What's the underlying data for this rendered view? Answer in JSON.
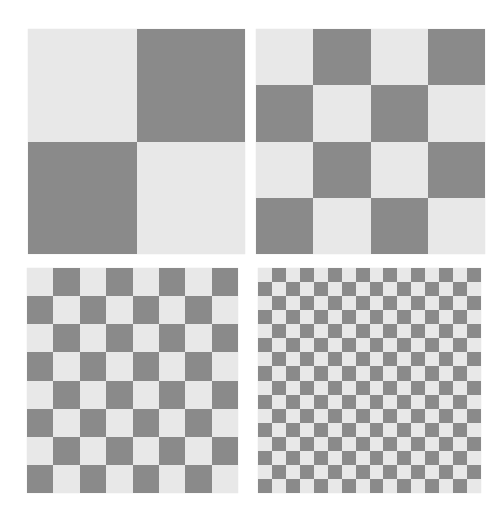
{
  "figure": {
    "canvas": {
      "width": 495,
      "height": 522,
      "background": "#ffffff"
    },
    "colors": {
      "light": "#e8e8e8",
      "dark": "#8a8a8a"
    },
    "boards": [
      {
        "name": "checkerboard-2x2",
        "grid": 2,
        "x": 28,
        "y": 29,
        "width": 217,
        "height": 225,
        "first_cell": "light"
      },
      {
        "name": "checkerboard-4x4",
        "grid": 4,
        "x": 256,
        "y": 29,
        "width": 229,
        "height": 225,
        "first_cell": "light"
      },
      {
        "name": "checkerboard-8x8",
        "grid": 8,
        "x": 27,
        "y": 268,
        "width": 211,
        "height": 225,
        "first_cell": "light"
      },
      {
        "name": "checkerboard-16x16",
        "grid": 16,
        "x": 258,
        "y": 268,
        "width": 223,
        "height": 225,
        "first_cell": "light"
      }
    ]
  }
}
